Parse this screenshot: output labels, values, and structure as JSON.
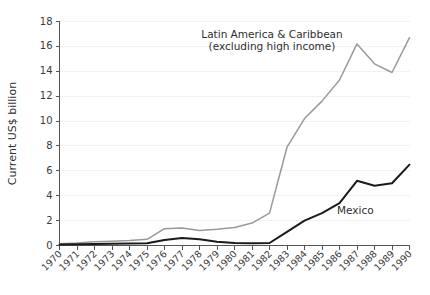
{
  "chart_data": {
    "type": "line",
    "title": "",
    "xlabel": "",
    "ylabel": "Current US$ billion",
    "ylim": [
      0,
      18
    ],
    "xlim": [
      1970,
      1990
    ],
    "yticks": [
      0,
      2,
      4,
      6,
      8,
      10,
      12,
      14,
      16,
      18
    ],
    "grid": true,
    "legend_position": "inline-annotation",
    "x": [
      1970,
      1971,
      1972,
      1973,
      1974,
      1975,
      1976,
      1977,
      1978,
      1979,
      1980,
      1981,
      1982,
      1983,
      1984,
      1985,
      1986,
      1987,
      1988,
      1989,
      1990
    ],
    "categories": [
      "1970",
      "1971",
      "1972",
      "1973",
      "1974",
      "1975",
      "1976",
      "1977",
      "1978",
      "1979",
      "1980",
      "1981",
      "1982",
      "1983",
      "1984",
      "1985",
      "1986",
      "1987",
      "1988",
      "1989",
      "1990"
    ],
    "series": [
      {
        "name": "Latin America & Caribbean (excluding high income)",
        "color": "#999999",
        "values": [
          0.15,
          0.2,
          0.3,
          0.35,
          0.4,
          0.5,
          1.35,
          1.4,
          1.2,
          1.3,
          1.45,
          1.8,
          2.6,
          7.9,
          10.2,
          11.6,
          13.3,
          16.2,
          14.6,
          13.9,
          16.7
        ]
      },
      {
        "name": "Mexico",
        "color": "#1a1a1a",
        "values": [
          0.08,
          0.1,
          0.12,
          0.14,
          0.16,
          0.18,
          0.45,
          0.6,
          0.5,
          0.3,
          0.2,
          0.18,
          0.2,
          1.1,
          2.0,
          2.6,
          3.4,
          5.2,
          4.8,
          5.0,
          6.5
        ]
      }
    ],
    "annotations": [
      {
        "name": "latin-america-label",
        "lines": [
          "Latin America & Caribbean",
          "(excluding high income)"
        ],
        "x": 272,
        "y": 38
      },
      {
        "name": "mexico-label",
        "lines": [
          "Mexico"
        ],
        "x": 337,
        "y": 214
      }
    ]
  }
}
